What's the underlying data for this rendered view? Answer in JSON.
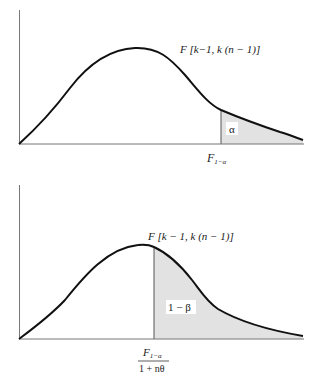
{
  "colors": {
    "curve": "#111111",
    "axis": "#555555",
    "shade": "#e2e2e2",
    "label_bg": "#ffffff"
  },
  "top_panel": {
    "distribution_label": "F [k−1, k (n − 1)]",
    "critical_value_label_main": "F",
    "critical_value_label_sub": "1−α",
    "shaded_region_label": "α"
  },
  "bottom_panel": {
    "distribution_label": "F [k − 1, k (n − 1)]",
    "critical_value_numerator_main": "F",
    "critical_value_numerator_sub": "1−α",
    "critical_value_denominator": "1 + nθ",
    "shaded_region_label": "1 − β"
  }
}
